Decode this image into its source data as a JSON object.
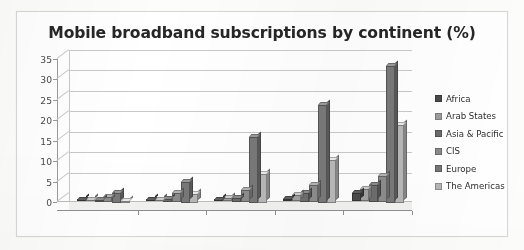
{
  "chart_data": {
    "type": "bar",
    "title": "Mobile broadband subscriptions by continent (%)",
    "xlabel": "",
    "ylabel": "",
    "categories": [
      "2005",
      "2006",
      "2007",
      "2008",
      "2009"
    ],
    "ylim": [
      0,
      35
    ],
    "yticks": [
      0,
      5,
      10,
      15,
      20,
      25,
      30,
      35
    ],
    "ytick_labels": [
      "0",
      "5",
      "10",
      "15",
      "20",
      "25",
      "30",
      "35"
    ],
    "grid": true,
    "legend_position": "right",
    "style": "3d-grouped-bar",
    "series": [
      {
        "name": "Africa",
        "color": "#4a4a4a",
        "values": [
          0.1,
          0.2,
          0.3,
          0.5,
          2.0
        ]
      },
      {
        "name": "Arab States",
        "color": "#9e9e9e",
        "values": [
          0.2,
          0.4,
          0.8,
          1.6,
          3.1
        ]
      },
      {
        "name": "Asia & Pacific",
        "color": "#6b6b6b",
        "values": [
          0.4,
          0.6,
          1.0,
          2.2,
          4.0
        ]
      },
      {
        "name": "CIS",
        "color": "#8a8a8a",
        "values": [
          1.2,
          2.3,
          3.0,
          4.1,
          6.4
        ]
      },
      {
        "name": "Europe",
        "color": "#777777",
        "values": [
          2.4,
          5.0,
          16.0,
          24.0,
          33.5
        ]
      },
      {
        "name": "The Americas",
        "color": "#b5b5b5",
        "values": [
          0.5,
          2.1,
          7.0,
          10.5,
          19.0
        ]
      }
    ]
  }
}
